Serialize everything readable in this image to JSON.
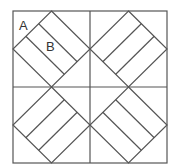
{
  "diagram": {
    "type": "quilt-block",
    "labels": [
      {
        "text": "A",
        "region": "corner triangle, top-left quadrant"
      },
      {
        "text": "B",
        "region": "middle strip of diamond, top-left quadrant"
      }
    ],
    "quadrants": [
      {
        "position": "top-left",
        "stripe_direction": "diagonal-down"
      },
      {
        "position": "top-right",
        "stripe_direction": "diagonal-up"
      },
      {
        "position": "bottom-left",
        "stripe_direction": "diagonal-up"
      },
      {
        "position": "bottom-right",
        "stripe_direction": "diagonal-down"
      }
    ],
    "colors": {
      "line": "#555555",
      "background": "#ffffff",
      "label": "#333333"
    }
  }
}
